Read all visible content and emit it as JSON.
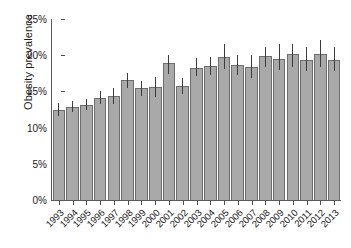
{
  "chart_data": {
    "type": "bar",
    "title": "",
    "subtitle": "",
    "xlabel": "",
    "ylabel": "Obesity prevalence",
    "ylim": [
      0,
      25
    ],
    "yunit": "%",
    "grid": false,
    "legend": null,
    "ytick_labels": [
      "0%",
      "5%",
      "10%",
      "15%",
      "20%",
      "25%"
    ],
    "ytick_values": [
      0,
      5,
      10,
      15,
      20,
      25
    ],
    "categories": [
      "1993",
      "1994",
      "1995",
      "1996",
      "1997",
      "1998",
      "1999",
      "2000",
      "2001",
      "2002",
      "2003",
      "2004",
      "2005",
      "2006",
      "2007",
      "2008",
      "2009",
      "2010",
      "2011",
      "2012",
      "2013"
    ],
    "values": [
      12.5,
      12.9,
      13.1,
      14.1,
      14.4,
      16.6,
      15.5,
      15.6,
      18.9,
      15.8,
      18.3,
      18.5,
      19.7,
      18.6,
      18.4,
      19.9,
      19.5,
      20.1,
      19.4,
      20.2,
      19.4
    ],
    "error_low": [
      11.6,
      12.2,
      12.4,
      13.2,
      13.2,
      15.5,
      14.3,
      14.2,
      17.4,
      14.7,
      17.1,
      17.3,
      18.1,
      17.2,
      16.9,
      18.4,
      17.9,
      18.4,
      17.8,
      18.4,
      17.8
    ],
    "error_high": [
      13.4,
      13.7,
      13.9,
      15.1,
      15.5,
      17.6,
      16.4,
      17.0,
      20.0,
      16.9,
      19.6,
      19.8,
      21.5,
      20.0,
      20.0,
      21.2,
      21.6,
      21.6,
      21.1,
      22.1,
      21.1
    ],
    "error_style": "vertical-line-no-caps",
    "bar_fill_color": "#a9a9a9",
    "bar_edge_color": "#6e6e6e",
    "error_color": "#3c3c3c",
    "axis_color": "#5a5a5a",
    "text_color": "#1a1a1a",
    "background_color": "#ffffff",
    "xtick_label_rotation": -45
  }
}
